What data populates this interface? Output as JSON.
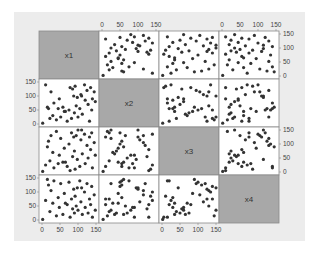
{
  "chart_data": {
    "type": "scatter",
    "subtype": "scatter-matrix",
    "title": "",
    "variables": [
      "x1",
      "x2",
      "x3",
      "x4"
    ],
    "axis_range": [
      0,
      150
    ],
    "ticks": [
      0,
      50,
      100,
      150
    ],
    "tick_labels": [
      "0",
      "50",
      "100",
      "150"
    ],
    "grid": false,
    "legend": null,
    "axis_placement": {
      "top": [
        1,
        3
      ],
      "bottom": [
        0,
        2
      ],
      "left": [
        1,
        3
      ],
      "right": [
        0,
        2
      ]
    },
    "data": {
      "x1": [
        2,
        10,
        18,
        22,
        25,
        30,
        33,
        40,
        45,
        48,
        52,
        58,
        62,
        70,
        75,
        78,
        82,
        85,
        88,
        90,
        92,
        95,
        98,
        100,
        105,
        108,
        112,
        118,
        120,
        125,
        128,
        132,
        135,
        138,
        140,
        145,
        148,
        15,
        65,
        110
      ],
      "x2": [
        3,
        140,
        55,
        20,
        115,
        30,
        75,
        15,
        55,
        90,
        25,
        60,
        45,
        10,
        50,
        130,
        20,
        125,
        100,
        40,
        135,
        65,
        95,
        25,
        55,
        105,
        35,
        140,
        85,
        120,
        70,
        10,
        130,
        50,
        90,
        115,
        80,
        60,
        45,
        100
      ],
      "x3": [
        2,
        25,
        110,
        40,
        130,
        70,
        15,
        145,
        30,
        60,
        120,
        35,
        85,
        20,
        100,
        5,
        140,
        55,
        125,
        75,
        10,
        130,
        45,
        150,
        20,
        115,
        65,
        135,
        30,
        95,
        50,
        125,
        80,
        140,
        15,
        105,
        60,
        90,
        35,
        150
      ],
      "x4": [
        2,
        70,
        125,
        30,
        105,
        60,
        140,
        15,
        80,
        45,
        130,
        20,
        95,
        55,
        135,
        10,
        75,
        40,
        110,
        25,
        85,
        50,
        115,
        35,
        140,
        65,
        20,
        100,
        45,
        130,
        25,
        75,
        55,
        120,
        10,
        90,
        35,
        145,
        60,
        115
      ]
    }
  },
  "colors": {
    "figure_background": "#ececec",
    "cell_background": "#ffffff",
    "diagonal_fill": "#a8a8a8",
    "grid_border": "#8a8a8a",
    "point": "#333333",
    "text": "#444444"
  }
}
